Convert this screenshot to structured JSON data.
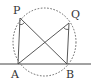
{
  "diagram": {
    "type": "geometry",
    "points": {
      "P": {
        "label": "P",
        "x": 20,
        "y": 18
      },
      "Q": {
        "label": "Q",
        "x": 69,
        "y": 23
      },
      "A": {
        "label": "A",
        "x": 18,
        "y": 64
      },
      "B": {
        "label": "B",
        "x": 67,
        "y": 64
      }
    },
    "segments": [
      "PA",
      "PB",
      "QA",
      "QB"
    ],
    "baseline": {
      "y": 64,
      "x1": 0,
      "x2": 91
    },
    "circle": {
      "cx": 44.5,
      "cy": 42,
      "rx": 31.5,
      "ry": 34,
      "style": "dotted"
    },
    "angle_marks": [
      "APB",
      "AQB"
    ],
    "colors": {
      "line": "#444444",
      "circle": "#555555",
      "text": "#333333"
    }
  }
}
